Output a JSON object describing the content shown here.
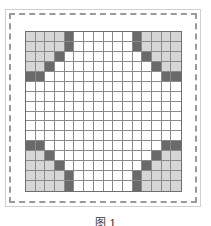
{
  "figure": {
    "caption": "图 1",
    "grid": {
      "rows": 16,
      "cols": 16,
      "colors": {
        "light": "#d6d6d6",
        "dark": "#6a6a6a",
        "empty": "#ffffff",
        "line": "#8a8a8a"
      },
      "pattern": [
        "LLLLD000000DLLLL",
        "LLLLD000000DLLLL",
        "LLLD00000000DLLL",
        "LLD0000000000DLL",
        "DD000000000000DD",
        "0000000000000000",
        "0000000000000000",
        "0000000000000000",
        "0000000000000000",
        "0000000000000000",
        "0000000000000000",
        "DD000000000000DD",
        "LLD0000000000DLL",
        "LLLD00000000DLLL",
        "LLLLD000000DLLLL",
        "LLLLD000000DLLLL"
      ]
    }
  }
}
